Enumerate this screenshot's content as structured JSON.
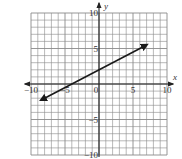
{
  "chart_data": {
    "type": "line",
    "title": "",
    "xlabel": "x",
    "ylabel": "y",
    "xlim": [
      -10,
      10
    ],
    "ylim": [
      -10,
      10
    ],
    "grid": true,
    "grid_step": 1,
    "x_ticks": [
      {
        "value": -10,
        "label": "-10"
      },
      {
        "value": -5,
        "label": "-5"
      },
      {
        "value": 0,
        "label": "0"
      },
      {
        "value": 5,
        "label": "5"
      },
      {
        "value": 10,
        "label": "10"
      }
    ],
    "y_ticks": [
      {
        "value": 10,
        "label": "10"
      },
      {
        "value": 5,
        "label": "5"
      },
      {
        "value": -5,
        "label": "-5"
      },
      {
        "value": -10,
        "label": "-10"
      }
    ],
    "series": [
      {
        "name": "line",
        "equation": "y = 0.5x + 2",
        "slope": 0.5,
        "intercept": 2,
        "arrows": "both",
        "x": [
          -8.5,
          -4,
          0,
          7
        ],
        "y": [
          -2.25,
          0,
          2,
          5.5
        ]
      }
    ],
    "legend": null
  },
  "colors": {
    "grid": "#8a8a8a",
    "axis": "#222222",
    "line": "#1a1a1a",
    "background": "#ffffff"
  }
}
